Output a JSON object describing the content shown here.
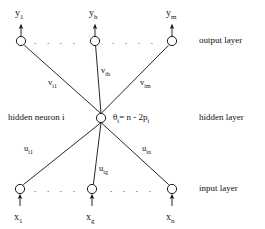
{
  "figure": {
    "bg_color": "#ffffff",
    "ink_color": "#111111"
  },
  "layers": {
    "output": {
      "name": "output layer",
      "y": 41,
      "nodes": [
        {
          "id": "y1",
          "label": "y",
          "sub": "1",
          "x": 21
        },
        {
          "id": "yh",
          "label": "y",
          "sub": "h",
          "x": 95
        },
        {
          "id": "ym",
          "label": "y",
          "sub": "m",
          "x": 172
        }
      ],
      "ellipsis": ". . . ."
    },
    "hidden": {
      "name": "hidden layer",
      "y": 118,
      "caption": "hidden neuron  i",
      "threshold_eq": "θ",
      "threshold_sub": "i",
      "threshold_rest": "= n - 2p",
      "threshold_rest_sub": "i",
      "node": {
        "id": "hi",
        "x": 101
      }
    },
    "input": {
      "name": "input layer",
      "y": 189,
      "nodes": [
        {
          "id": "x1",
          "label": "x",
          "sub": "1",
          "x": 20
        },
        {
          "id": "xg",
          "label": "x",
          "sub": "g",
          "x": 92
        },
        {
          "id": "xn",
          "label": "x",
          "sub": "n",
          "x": 172
        }
      ],
      "ellipsis": ". . . ."
    }
  },
  "weights": {
    "output_side": [
      {
        "id": "vi1",
        "label": "v",
        "sub": "i1",
        "x": 48,
        "y": 82
      },
      {
        "id": "vih",
        "label": "v",
        "sub": "ih",
        "x": 101,
        "y": 70
      },
      {
        "id": "vim",
        "label": "v",
        "sub": "im",
        "x": 140,
        "y": 82
      }
    ],
    "input_side": [
      {
        "id": "ui1",
        "label": "u",
        "sub": "i1",
        "x": 24,
        "y": 148
      },
      {
        "id": "uig",
        "label": "u",
        "sub": "ig",
        "x": 99,
        "y": 168
      },
      {
        "id": "uin",
        "label": "u",
        "sub": "in",
        "x": 142,
        "y": 148
      }
    ]
  },
  "geometry": {
    "node_radius": 4.6,
    "stroke_width": 0.9,
    "arrow_length": 13
  }
}
